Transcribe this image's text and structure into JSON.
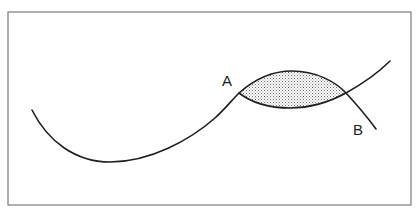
{
  "diagram": {
    "labels": {
      "point_a": "A",
      "point_b": "B"
    },
    "elements": [
      {
        "id": "curve-1",
        "description": "long S-shaped curve rising from lower-left to upper-right"
      },
      {
        "id": "curve-2",
        "description": "arc from point A curving up and over, down to point B"
      },
      {
        "id": "shaded-region",
        "description": "lens-shaped area enclosed between the two curves, stippled fill"
      }
    ],
    "colors": {
      "line": "#1e1e1e",
      "frame": "#7a7a7a",
      "shading_dot": "#6e6e6e",
      "background": "#ffffff"
    }
  }
}
